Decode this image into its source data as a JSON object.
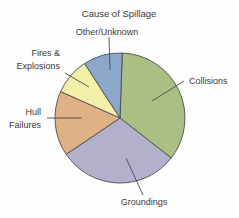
{
  "chart_data": {
    "type": "pie",
    "title": "Cause of Spillage",
    "xlabel": "",
    "ylabel": "",
    "legend_position": "none",
    "grid": false,
    "categories": [
      "Collisions",
      "Groundings",
      "Hull Failures",
      "Fires & Explosions",
      "Other/Unknown"
    ],
    "values": [
      35,
      30,
      16,
      9,
      10
    ],
    "colors": [
      "#a9bf84",
      "#b3b0cc",
      "#e0b184",
      "#f2efa8",
      "#8ba7c9"
    ],
    "slices": [
      {
        "label": "Collisions",
        "value": 35,
        "color": "#a9bf84",
        "start_angle": 2,
        "end_angle": 128
      },
      {
        "label": "Groundings",
        "value": 30,
        "color": "#b3b0cc",
        "start_angle": 128,
        "end_angle": 236
      },
      {
        "label": "Hull Failures",
        "value": 16,
        "color": "#e0b184",
        "start_angle": 236,
        "end_angle": 294
      },
      {
        "label": "Fires & Explosions",
        "value": 9,
        "color": "#f2efa8",
        "start_angle": 294,
        "end_angle": 327
      },
      {
        "label": "Other/Unknown",
        "value": 10,
        "color": "#8ba7c9",
        "start_angle": 327,
        "end_angle": 362
      }
    ]
  },
  "labels": {
    "title": "Cause of Spillage",
    "collisions": "Collisions",
    "groundings": "Groundings",
    "hull_failures_line1": "Hull",
    "hull_failures_line2": "Failures",
    "fires_line1": "Fires &",
    "fires_line2": "Explosions",
    "other_unknown": "Other/Unknown"
  }
}
